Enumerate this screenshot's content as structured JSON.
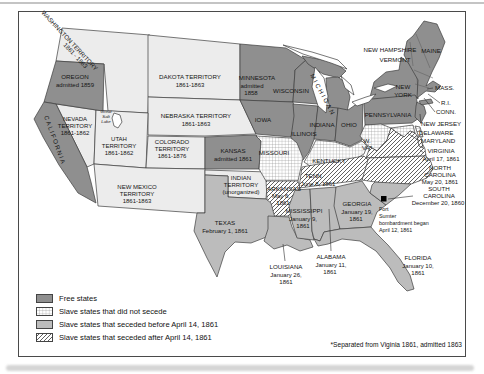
{
  "colors": {
    "free_states": "#8f8f8f",
    "seceded_before": "#bcbcbc",
    "territory": "#ececec",
    "hatch_line": "#4f4f4f",
    "grid_line": "#8d8d8d",
    "map_border": "#3d3d3d",
    "background": "#ffffff"
  },
  "legend": {
    "items": [
      {
        "key": "free",
        "label": "Free states"
      },
      {
        "key": "grid",
        "label": "Slave states that did not secede"
      },
      {
        "key": "before",
        "label": "Slave states that seceded before April 14, 1861"
      },
      {
        "key": "after",
        "label": "Slave states that seceded after April 14, 1861"
      }
    ]
  },
  "footnote": "*Separated from Viginia 1861, admitted 1863",
  "labels": {
    "washington_territory": {
      "lines": [
        "WASHINGTON TERRITORY",
        "1861 - 1863"
      ]
    },
    "oregon": {
      "lines": [
        "OREGON",
        "admitted 1859"
      ]
    },
    "california": {
      "lines": [
        "CALIFORNIA"
      ]
    },
    "nevada": {
      "lines": [
        "NEVADA",
        "TERRITORY",
        "1861-1862"
      ]
    },
    "great_salt_lake": {
      "lines": [
        "Great",
        "Salt",
        "Lake"
      ]
    },
    "utah": {
      "lines": [
        "UTAH",
        "TERRITORY",
        "1861-1862"
      ]
    },
    "colorado": {
      "lines": [
        "COLORADO",
        "TERRITORY",
        "1861-1876"
      ]
    },
    "dakota": {
      "lines": [
        "DAKOTA TERRITORY",
        "1861-1863"
      ]
    },
    "nebraska": {
      "lines": [
        "NEBRASKA TERRITORY",
        "1861-1863"
      ]
    },
    "kansas": {
      "lines": [
        "KANSAS",
        "admitted 1861"
      ]
    },
    "new_mexico": {
      "lines": [
        "NEW MEXICO",
        "TERRITORY",
        "1861-1863"
      ]
    },
    "indian_territory": {
      "lines": [
        "INDIAN",
        "TERRITORY",
        "(unorganized)"
      ]
    },
    "texas": {
      "lines": [
        "TEXAS",
        "February 1, 1861"
      ]
    },
    "minnesota": {
      "lines": [
        "MINNESOTA",
        "admitted",
        "1858"
      ]
    },
    "wisconsin": {
      "lines": [
        "WISCONSIN"
      ]
    },
    "michigan": {
      "lines": [
        "MICHIGAN"
      ]
    },
    "iowa": {
      "lines": [
        "IOWA"
      ]
    },
    "illinois": {
      "lines": [
        "ILLINOIS"
      ]
    },
    "indiana": {
      "lines": [
        "INDIANA"
      ]
    },
    "ohio": {
      "lines": [
        "OHIO"
      ]
    },
    "missouri": {
      "lines": [
        "MISSOURI"
      ]
    },
    "kentucky": {
      "lines": [
        "KENTUCKY"
      ]
    },
    "tennessee": {
      "lines": [
        "TENN.",
        "June 8, 1861"
      ]
    },
    "arkansas": {
      "lines": [
        "ARKANSAS",
        "May 6,",
        "1861"
      ]
    },
    "louisiana": {
      "lines": [
        "LOUISIANA",
        "January 26,",
        "1861"
      ]
    },
    "mississippi": {
      "lines": [
        "MISSISSIPPI",
        "January 9,",
        "1861"
      ]
    },
    "alabama": {
      "lines": [
        "ALABAMA",
        "January 11,",
        "1861"
      ]
    },
    "georgia": {
      "lines": [
        "GEORGIA",
        "January 19,",
        "1861"
      ]
    },
    "florida": {
      "lines": [
        "FLORIDA",
        "January 10,",
        "1861"
      ]
    },
    "south_carolina": {
      "lines": [
        "SOUTH",
        "CAROLINA",
        "December 20, 1860"
      ]
    },
    "fort_sumter": {
      "lines": [
        "Fort",
        "Sumter",
        "bombardment began",
        "April 12, 1861"
      ]
    },
    "north_carolina": {
      "lines": [
        "NORTH",
        "CAROLINA",
        "May 20, 1861"
      ]
    },
    "virginia": {
      "lines": [
        "VIRGINIA",
        "April 17, 1861"
      ]
    },
    "west_virginia": {
      "lines": [
        "W.",
        "VA*"
      ]
    },
    "maryland": {
      "lines": [
        "MARYLAND"
      ]
    },
    "delaware": {
      "lines": [
        "DELAWARE"
      ]
    },
    "new_jersey": {
      "lines": [
        "NEW JERSEY"
      ]
    },
    "pennsylvania": {
      "lines": [
        "PENNSYLVANIA"
      ]
    },
    "new_york": {
      "lines": [
        "NEW",
        "YORK"
      ]
    },
    "new_hampshire": {
      "lines": [
        "NEW HAMPSHIRE"
      ]
    },
    "vermont": {
      "lines": [
        "VERMONT"
      ]
    },
    "maine": {
      "lines": [
        "MAINE"
      ]
    },
    "massachusetts": {
      "lines": [
        "MASS."
      ]
    },
    "rhode_island": {
      "lines": [
        "R.I."
      ]
    },
    "connecticut": {
      "lines": [
        "CONN."
      ]
    }
  }
}
